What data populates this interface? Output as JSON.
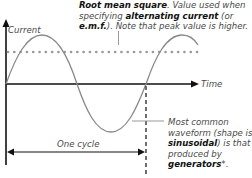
{
  "annotations": {
    "rms": {
      "line1_bold": "Root mean square",
      "line1_rest": ". Value used when",
      "line2_pre": "specifying ",
      "line2_bold": "alternating current",
      "line2_post": " (or",
      "line3_bold": "e.m.f.",
      "line3_rest": "). Note that peak value is higher."
    },
    "waveform": {
      "line1": "Most common",
      "line2": "waveform (shape is",
      "line3_bold": "sinusoidal",
      "line3_rest": ") is that",
      "line4": "produced by",
      "line5_bold": "generators",
      "line5_rest": "*."
    }
  },
  "axes": {
    "y_label": "Current",
    "x_label": "Time"
  },
  "cycle_label": "One cycle",
  "colors": {
    "axis": "#111111",
    "wave": "#8a8a8a",
    "rms_dots": "#9a9a9a",
    "text": "#4a4a4a",
    "bold_text": "#111111"
  }
}
